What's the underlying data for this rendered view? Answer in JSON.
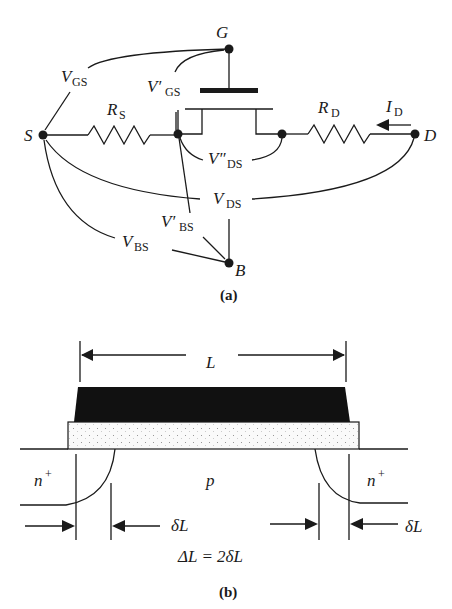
{
  "figure_a": {
    "caption": "(a)",
    "nodes": {
      "gate": "G",
      "source": "S",
      "drain": "D",
      "body": "B"
    },
    "resistors": {
      "source": {
        "main": "R",
        "sub": "S"
      },
      "drain": {
        "main": "R",
        "sub": "D"
      }
    },
    "current": {
      "main": "I",
      "sub": "D"
    },
    "voltages": {
      "vgs": {
        "main": "V",
        "sub": "GS"
      },
      "vgs_int": {
        "main": "V′",
        "sub": "GS"
      },
      "vds_int": {
        "main": "V″",
        "sub": "DS"
      },
      "vds": {
        "main": "V",
        "sub": "DS"
      },
      "vbs_int": {
        "main": "V′",
        "sub": "BS"
      },
      "vbs": {
        "main": "V",
        "sub": "BS"
      }
    }
  },
  "figure_b": {
    "caption": "(b)",
    "length_label": "L",
    "left_region": {
      "main": "n",
      "sup": "+"
    },
    "right_region": {
      "main": "n",
      "sup": "+"
    },
    "substrate": "p",
    "delta_left": "δL",
    "delta_right": "δL",
    "equation": "ΔL = 2δL"
  }
}
